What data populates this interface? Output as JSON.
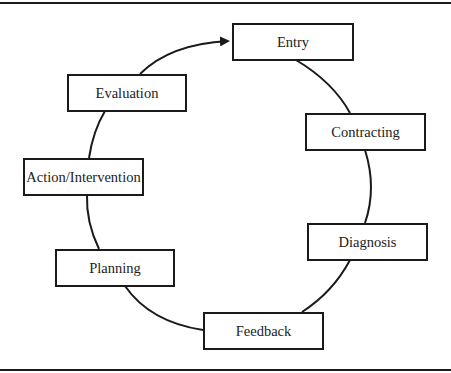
{
  "diagram": {
    "type": "cycle",
    "direction": "counter-clockwise",
    "colors": {
      "stroke": "#1a1a1a",
      "text": "#222222",
      "background": "#ffffff"
    },
    "nodes": [
      {
        "id": "entry",
        "label": "Entry"
      },
      {
        "id": "contracting",
        "label": "Contracting"
      },
      {
        "id": "diagnosis",
        "label": "Diagnosis"
      },
      {
        "id": "feedback",
        "label": "Feedback"
      },
      {
        "id": "planning",
        "label": "Planning"
      },
      {
        "id": "action",
        "label": "Action/Intervention"
      },
      {
        "id": "evaluation",
        "label": "Evaluation"
      }
    ],
    "edges": [
      {
        "from": "entry",
        "to": "contracting",
        "arrow": false
      },
      {
        "from": "contracting",
        "to": "diagnosis",
        "arrow": false
      },
      {
        "from": "diagnosis",
        "to": "feedback",
        "arrow": false
      },
      {
        "from": "feedback",
        "to": "planning",
        "arrow": false
      },
      {
        "from": "planning",
        "to": "action",
        "arrow": false
      },
      {
        "from": "action",
        "to": "evaluation",
        "arrow": false
      },
      {
        "from": "evaluation",
        "to": "entry",
        "arrow": true
      }
    ]
  }
}
